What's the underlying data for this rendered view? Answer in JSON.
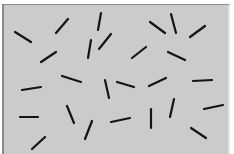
{
  "stimulus": {
    "background_color": "#cbcbcb",
    "line_color": "#141414",
    "segments": [
      {
        "x1": 15,
        "y1": 32,
        "x2": 31,
        "y2": 42
      },
      {
        "x1": 56,
        "y1": 33,
        "x2": 68,
        "y2": 19
      },
      {
        "x1": 101,
        "y1": 13,
        "x2": 98,
        "y2": 30
      },
      {
        "x1": 99,
        "y1": 49,
        "x2": 111,
        "y2": 34
      },
      {
        "x1": 88,
        "y1": 58,
        "x2": 91,
        "y2": 40
      },
      {
        "x1": 41,
        "y1": 62,
        "x2": 56,
        "y2": 52
      },
      {
        "x1": 150,
        "y1": 22,
        "x2": 165,
        "y2": 33
      },
      {
        "x1": 171,
        "y1": 14,
        "x2": 176,
        "y2": 33
      },
      {
        "x1": 190,
        "y1": 37,
        "x2": 205,
        "y2": 26
      },
      {
        "x1": 132,
        "y1": 58,
        "x2": 146,
        "y2": 47
      },
      {
        "x1": 168,
        "y1": 52,
        "x2": 185,
        "y2": 60
      },
      {
        "x1": 62,
        "y1": 76,
        "x2": 81,
        "y2": 82
      },
      {
        "x1": 22,
        "y1": 90,
        "x2": 41,
        "y2": 87
      },
      {
        "x1": 105,
        "y1": 80,
        "x2": 109,
        "y2": 98
      },
      {
        "x1": 117,
        "y1": 82,
        "x2": 134,
        "y2": 87
      },
      {
        "x1": 149,
        "y1": 86,
        "x2": 166,
        "y2": 78
      },
      {
        "x1": 193,
        "y1": 81,
        "x2": 212,
        "y2": 80
      },
      {
        "x1": 20,
        "y1": 117,
        "x2": 38,
        "y2": 117
      },
      {
        "x1": 67,
        "y1": 106,
        "x2": 74,
        "y2": 123
      },
      {
        "x1": 85,
        "y1": 139,
        "x2": 92,
        "y2": 121
      },
      {
        "x1": 32,
        "y1": 149,
        "x2": 45,
        "y2": 137
      },
      {
        "x1": 111,
        "y1": 122,
        "x2": 130,
        "y2": 118
      },
      {
        "x1": 151,
        "y1": 109,
        "x2": 151,
        "y2": 128
      },
      {
        "x1": 170,
        "y1": 117,
        "x2": 174,
        "y2": 99
      },
      {
        "x1": 204,
        "y1": 109,
        "x2": 223,
        "y2": 105
      },
      {
        "x1": 191,
        "y1": 128,
        "x2": 206,
        "y2": 138
      }
    ]
  }
}
